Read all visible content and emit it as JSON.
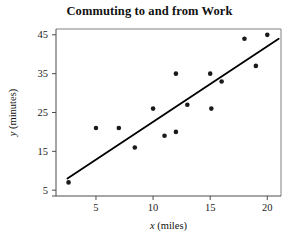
{
  "chart_data": {
    "type": "scatter",
    "title": "Commuting to and from Work",
    "xlabel": "x (miles)",
    "ylabel": "y (minutes)",
    "xlabel_var": "x",
    "xlabel_unit": " (miles)",
    "ylabel_var": "y",
    "ylabel_unit": " (minutes)",
    "xlim": [
      1.5,
      21.2
    ],
    "ylim": [
      3.5,
      46.5
    ],
    "xticks": [
      5,
      10,
      15,
      20
    ],
    "ytick_labels": [
      "5",
      "15",
      "25",
      "35",
      "45"
    ],
    "yticks": [
      5,
      15,
      25,
      35,
      45
    ],
    "grid": false,
    "legend": false,
    "marker": "filled-circle",
    "marker_color": "#1a1a1a",
    "line_color": "#000000",
    "axis_color": "#808080",
    "points": [
      {
        "x": 2.6,
        "y": 7
      },
      {
        "x": 5.0,
        "y": 21
      },
      {
        "x": 7.0,
        "y": 21
      },
      {
        "x": 8.4,
        "y": 16
      },
      {
        "x": 10.0,
        "y": 26
      },
      {
        "x": 11.0,
        "y": 19
      },
      {
        "x": 12.0,
        "y": 35
      },
      {
        "x": 12.0,
        "y": 20
      },
      {
        "x": 13.0,
        "y": 27
      },
      {
        "x": 15.0,
        "y": 35
      },
      {
        "x": 15.1,
        "y": 26
      },
      {
        "x": 16.0,
        "y": 33
      },
      {
        "x": 18.0,
        "y": 44
      },
      {
        "x": 19.0,
        "y": 37
      },
      {
        "x": 20.0,
        "y": 45
      }
    ],
    "trendline": {
      "x0": 2.5,
      "y0": 8.0,
      "x1": 21.0,
      "y1": 44.0
    }
  }
}
